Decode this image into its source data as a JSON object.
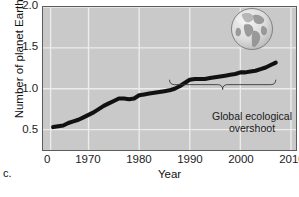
{
  "panel": {
    "letter": "c."
  },
  "chart_data": {
    "type": "line",
    "title": "",
    "xlabel": "Year",
    "ylabel": "Number of planet Earths",
    "xlim": [
      1961,
      2011
    ],
    "ylim": [
      0.25,
      2.0
    ],
    "xticks": [
      {
        "label": "0",
        "value": 1962
      },
      {
        "label": "1970",
        "value": 1970
      },
      {
        "label": "1980",
        "value": 1980
      },
      {
        "label": "1990",
        "value": 1990
      },
      {
        "label": "2000",
        "value": 2000
      },
      {
        "label": "2010",
        "value": 2010
      }
    ],
    "yticks": [
      {
        "label": "2.0",
        "value": 2.0
      },
      {
        "label": "1.5",
        "value": 1.5
      },
      {
        "label": "1.0",
        "value": 1.0
      },
      {
        "label": "0.5",
        "value": 0.5
      }
    ],
    "grid": true,
    "legend": false,
    "series": [
      {
        "name": "Global ecological footprint",
        "x": [
          1963,
          1964,
          1965,
          1966,
          1967,
          1968,
          1969,
          1970,
          1971,
          1972,
          1973,
          1974,
          1975,
          1976,
          1977,
          1978,
          1979,
          1980,
          1981,
          1982,
          1983,
          1984,
          1985,
          1986,
          1987,
          1988,
          1989,
          1990,
          1991,
          1992,
          1993,
          1994,
          1995,
          1996,
          1997,
          1998,
          1999,
          2000,
          2001,
          2002,
          2003,
          2004,
          2005,
          2006,
          2007
        ],
        "values": [
          0.53,
          0.54,
          0.55,
          0.58,
          0.6,
          0.62,
          0.65,
          0.68,
          0.71,
          0.75,
          0.79,
          0.82,
          0.85,
          0.88,
          0.88,
          0.87,
          0.88,
          0.92,
          0.93,
          0.94,
          0.95,
          0.96,
          0.97,
          0.98,
          1.0,
          1.03,
          1.07,
          1.11,
          1.12,
          1.12,
          1.12,
          1.13,
          1.14,
          1.15,
          1.16,
          1.17,
          1.18,
          1.2,
          1.2,
          1.21,
          1.22,
          1.24,
          1.26,
          1.29,
          1.32
        ]
      }
    ],
    "annotations": [
      {
        "name": "global-ecological-overshoot",
        "text_line1": "Global ecological",
        "text_line2": "overshoot",
        "brace_x_start": 1986,
        "brace_x_end": 2007,
        "brace_y": 1.05
      }
    ],
    "decorations": [
      {
        "name": "earth-globe",
        "x": 2002,
        "y": 1.73
      }
    ],
    "colors": {
      "plot_background": "#c9c9c9",
      "gridline": "#ececeb",
      "line": "#111111",
      "axis": "#5d5d5d",
      "text": "#111111"
    }
  }
}
